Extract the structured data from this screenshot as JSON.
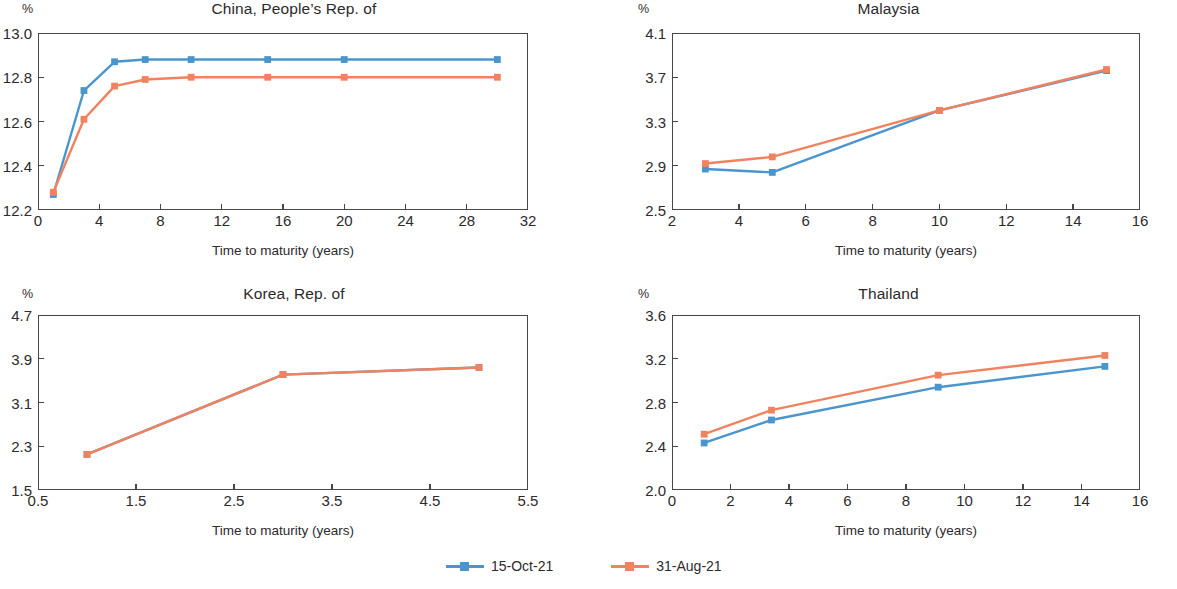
{
  "figure": {
    "unit_label": "%",
    "xaxis_title": "Time to maturity (years)"
  },
  "legend": {
    "items": [
      {
        "label": "15-Oct-21",
        "color": "#4a95cc"
      },
      {
        "label": "31-Aug-21",
        "color": "#f1825f"
      }
    ]
  },
  "chart_data": [
    {
      "type": "line",
      "title": "China, People’s Rep. of",
      "xlabel": "Time to maturity (years)",
      "ylabel": "%",
      "xlim": [
        0,
        32
      ],
      "ylim": [
        12.2,
        13.0
      ],
      "xticks": [
        0,
        4,
        8,
        12,
        16,
        20,
        24,
        28,
        32
      ],
      "xtick_labels": [
        "0",
        "4",
        "8",
        "12",
        "16",
        "20",
        "24",
        "28",
        "32"
      ],
      "yticks": [
        12.2,
        12.4,
        12.6,
        12.8,
        13.0
      ],
      "ytick_labels": [
        "12.2",
        "12.4",
        "12.6",
        "12.8",
        "13.0"
      ],
      "grid": false,
      "legend_position": "bottom-figure",
      "series": [
        {
          "name": "15-Oct-21",
          "color": "#4a95cc",
          "x": [
            1,
            3,
            5,
            7,
            10,
            15,
            20,
            30
          ],
          "values": [
            12.27,
            12.74,
            12.87,
            12.88,
            12.88,
            12.88,
            12.88,
            12.88
          ]
        },
        {
          "name": "31-Aug-21",
          "color": "#f1825f",
          "x": [
            1,
            3,
            5,
            7,
            10,
            15,
            20,
            30
          ],
          "values": [
            12.28,
            12.61,
            12.76,
            12.79,
            12.8,
            12.8,
            12.8,
            12.8
          ]
        }
      ]
    },
    {
      "type": "line",
      "title": "Malaysia",
      "xlabel": "Time to maturity (years)",
      "ylabel": "%",
      "xlim": [
        2,
        16
      ],
      "ylim": [
        2.5,
        4.1
      ],
      "xticks": [
        2,
        4,
        6,
        8,
        10,
        12,
        14,
        16
      ],
      "xtick_labels": [
        "2",
        "4",
        "6",
        "8",
        "10",
        "12",
        "14",
        "16"
      ],
      "yticks": [
        2.5,
        2.9,
        3.3,
        3.7,
        4.1
      ],
      "ytick_labels": [
        "2.5",
        "2.9",
        "3.3",
        "3.7",
        "4.1"
      ],
      "grid": false,
      "legend_position": "bottom-figure",
      "series": [
        {
          "name": "15-Oct-21",
          "color": "#4a95cc",
          "x": [
            3,
            5,
            10,
            15
          ],
          "values": [
            2.87,
            2.84,
            3.4,
            3.76
          ]
        },
        {
          "name": "31-Aug-21",
          "color": "#f1825f",
          "x": [
            3,
            5,
            10,
            15
          ],
          "values": [
            2.92,
            2.98,
            3.4,
            3.77
          ]
        }
      ]
    },
    {
      "type": "line",
      "title": "Korea, Rep. of",
      "xlabel": "Time to maturity (years)",
      "ylabel": "%",
      "xlim": [
        0.5,
        5.5
      ],
      "ylim": [
        1.5,
        4.7
      ],
      "xticks": [
        0.5,
        1.5,
        2.5,
        3.5,
        4.5,
        5.5
      ],
      "xtick_labels": [
        "0.5",
        "1.5",
        "2.5",
        "3.5",
        "4.5",
        "5.5"
      ],
      "yticks": [
        1.5,
        2.3,
        3.1,
        3.9,
        4.7
      ],
      "ytick_labels": [
        "1.5",
        "2.3",
        "3.1",
        "3.9",
        "4.7"
      ],
      "grid": false,
      "legend_position": "bottom-figure",
      "series": [
        {
          "name": "15-Oct-21",
          "color": "#4a95cc",
          "x": [
            1,
            3,
            5
          ],
          "values": [
            2.15,
            3.61,
            3.74
          ]
        },
        {
          "name": "31-Aug-21",
          "color": "#f1825f",
          "x": [
            1,
            3,
            5
          ],
          "values": [
            2.15,
            3.61,
            3.74
          ]
        }
      ]
    },
    {
      "type": "line",
      "title": "Thailand",
      "xlabel": "Time to maturity (years)",
      "ylabel": "%",
      "xlim": [
        0,
        16
      ],
      "ylim": [
        2.0,
        3.6
      ],
      "xticks": [
        0,
        2,
        4,
        6,
        8,
        10,
        12,
        14,
        16
      ],
      "xtick_labels": [
        "0",
        "2",
        "4",
        "6",
        "8",
        "10",
        "12",
        "14",
        "16"
      ],
      "yticks": [
        2.0,
        2.4,
        2.8,
        3.2,
        3.6
      ],
      "ytick_labels": [
        "2.0",
        "2.4",
        "2.8",
        "3.2",
        "3.6"
      ],
      "grid": false,
      "legend_position": "bottom-figure",
      "series": [
        {
          "name": "15-Oct-21",
          "color": "#4a95cc",
          "x": [
            1.1,
            3.4,
            9.1,
            14.8
          ],
          "values": [
            2.43,
            2.64,
            2.94,
            3.13
          ]
        },
        {
          "name": "31-Aug-21",
          "color": "#f1825f",
          "x": [
            1.1,
            3.4,
            9.1,
            14.8
          ],
          "values": [
            2.51,
            2.73,
            3.05,
            3.23
          ]
        }
      ]
    }
  ]
}
